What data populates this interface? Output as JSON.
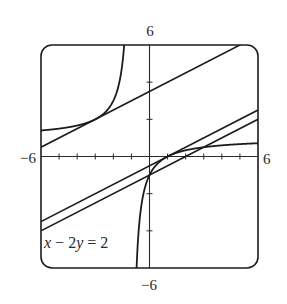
{
  "chart_data": {
    "type": "line",
    "title": "",
    "xlabel": "",
    "ylabel": "",
    "xlim": [
      -6,
      6
    ],
    "ylim": [
      -6,
      6
    ],
    "grid": false,
    "x_ticks_step": 1,
    "y_ticks_step": 2,
    "tick_labels": {
      "x_min": "−6",
      "x_max": "6",
      "y_min": "−6",
      "y_max": "6"
    },
    "series": [
      {
        "name": "curve",
        "kind": "function",
        "expression": "y = (x - 1)/(x + 1)",
        "vertical_asymptote": -1,
        "horizontal_asymptote": 1
      },
      {
        "name": "tangent line 1",
        "kind": "line",
        "expression": "y = 0.5x + 3.5",
        "slope": 0.5,
        "intercept": 3.5,
        "tangent_point": [
          -3,
          2
        ]
      },
      {
        "name": "tangent line 2",
        "kind": "line",
        "expression": "y = 0.5x - 0.5",
        "slope": 0.5,
        "intercept": -0.5,
        "tangent_point": [
          1,
          0
        ]
      },
      {
        "name": "x - 2y = 2",
        "kind": "line",
        "expression": "y = 0.5x - 1",
        "slope": 0.5,
        "intercept": -1
      }
    ],
    "annotations": [
      {
        "text_parts": [
          {
            "t": "x",
            "italic": true
          },
          {
            "t": " − 2",
            "italic": false
          },
          {
            "t": "y",
            "italic": true
          },
          {
            "t": " = 2",
            "italic": false
          }
        ],
        "plain": "x − 2y = 2",
        "position": [
          -5.85,
          -4.8
        ]
      }
    ]
  },
  "colors": {
    "stroke": "#1c1c1c",
    "axis": "#2a2a2a",
    "background": "#ffffff"
  }
}
